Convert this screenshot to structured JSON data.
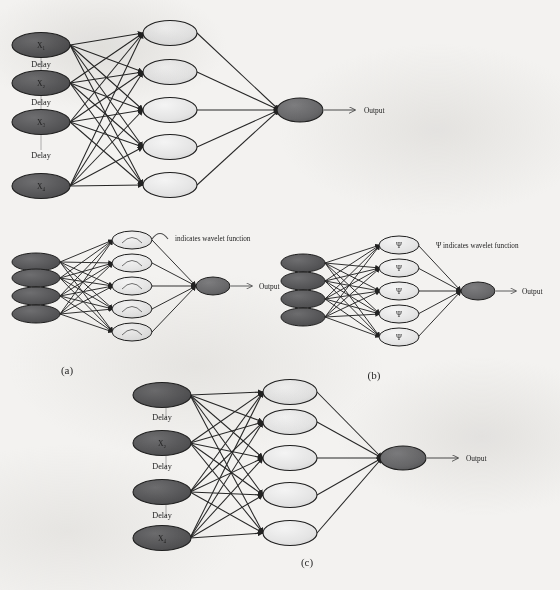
{
  "figure": {
    "top_text_fragment": "",
    "panels": [
      {
        "id": "panel-a",
        "label": "(a)",
        "input_nodes": [
          {
            "label": "X₁"
          },
          {
            "label": "X₂"
          },
          {
            "label": "X₃"
          },
          {
            "label": "X₄"
          }
        ],
        "delay_labels": [
          "Delay",
          "Delay",
          "Delay"
        ],
        "hidden_nodes": [
          "",
          "",
          "",
          "",
          ""
        ],
        "output_node": "",
        "output_label": "Output"
      },
      {
        "id": "panel-a-wavelet",
        "label": "(a)",
        "input_nodes": [
          {
            "label": ""
          },
          {
            "label": ""
          },
          {
            "label": ""
          },
          {
            "label": ""
          }
        ],
        "delay_labels": [],
        "hidden_nodes": [
          "wavelet-curve",
          "wavelet-curve",
          "wavelet-curve",
          "wavelet-curve",
          "wavelet-curve"
        ],
        "output_node": "",
        "output_label": "Output",
        "note": "indicates wavelet function"
      },
      {
        "id": "panel-b",
        "label": "(b)",
        "input_nodes": [
          {
            "label": ""
          },
          {
            "label": ""
          },
          {
            "label": ""
          },
          {
            "label": ""
          }
        ],
        "delay_labels": [],
        "hidden_nodes": [
          "Ψ",
          "Ψ",
          "Ψ",
          "Ψ",
          "Ψ"
        ],
        "output_node": "",
        "output_label": "Output",
        "note": "Ψ indicates wavelet function"
      },
      {
        "id": "panel-c",
        "label": "(c)",
        "input_nodes": [
          {
            "label": ""
          },
          {
            "label": "X₂"
          },
          {
            "label": ""
          },
          {
            "label": "X₄"
          }
        ],
        "delay_labels": [
          "Delay",
          "Delay",
          "Delay"
        ],
        "hidden_nodes": [
          "",
          "",
          "",
          "",
          ""
        ],
        "output_node": "",
        "output_label": "Output"
      }
    ],
    "colors": {
      "page_background": "#f3f2f0",
      "input_node_fill": "#58585a",
      "hidden_node_fill": "#e6e6e6",
      "output_node_fill": "#6a6a6c",
      "node_stroke": "#2a2a2a",
      "edge": "#262626",
      "text": "#232323"
    }
  }
}
